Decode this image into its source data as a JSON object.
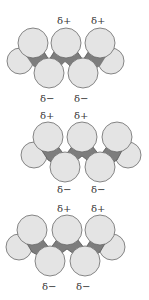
{
  "diagram": {
    "colors": {
      "atom_fill": "#e4e4e4",
      "atom_stroke": "#6a6a6a",
      "backbone_fill": "#7d7d7d",
      "label": "#333333"
    },
    "molecules": [
      {
        "top_labels": [
          "δ+",
          "δ+"
        ],
        "bottom_labels": [
          "δ−",
          "δ−"
        ]
      },
      {
        "top_labels": [
          "δ+",
          "δ+"
        ],
        "bottom_labels": [
          "δ−",
          "δ−"
        ]
      },
      {
        "top_labels": [
          "δ+",
          "δ+"
        ],
        "bottom_labels": [
          "δ−",
          "δ−"
        ]
      }
    ]
  }
}
